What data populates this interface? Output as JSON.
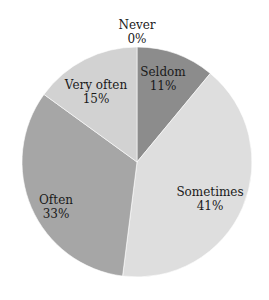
{
  "chart_data": {
    "type": "pie",
    "title": "",
    "categories": [
      "Never",
      "Seldom",
      "Sometimes",
      "Often",
      "Very often"
    ],
    "values": [
      0,
      11,
      41,
      33,
      15
    ],
    "labels": [
      "0%",
      "11%",
      "41%",
      "33%",
      "15%"
    ],
    "colors": [
      "#9a9a9a",
      "#8c8c8c",
      "#dedede",
      "#a6a6a6",
      "#d2d2d2"
    ],
    "start_angle_deg": 0,
    "direction": "clockwise",
    "legend": "none (data labels on slices)"
  },
  "slice_labels": [
    {
      "name": "Never",
      "pct": "0%"
    },
    {
      "name": "Seldom",
      "pct": "11%"
    },
    {
      "name": "Sometimes",
      "pct": "41%"
    },
    {
      "name": "Often",
      "pct": "33%"
    },
    {
      "name": "Very often",
      "pct": "15%"
    }
  ]
}
